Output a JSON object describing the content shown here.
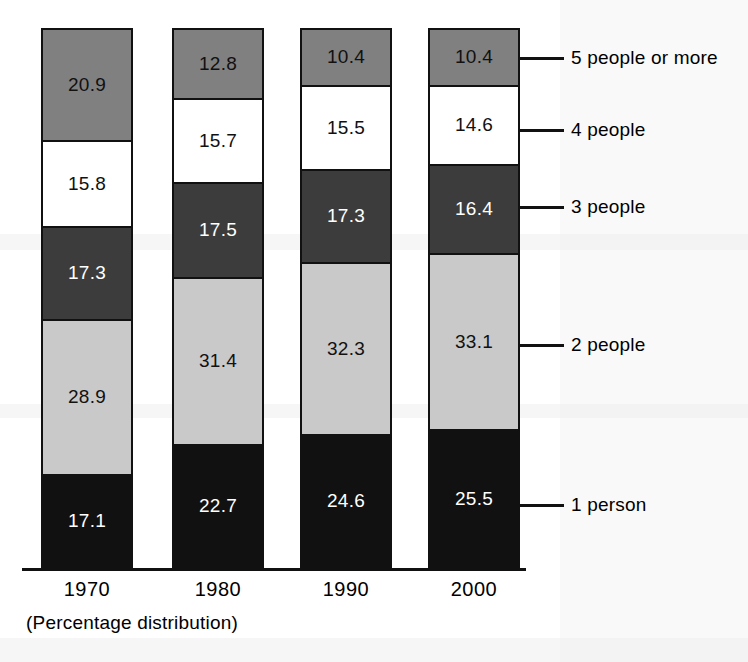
{
  "chart_data": {
    "type": "bar",
    "subtype": "stacked-bar-100-percent",
    "title": "",
    "caption": "(Percentage distribution)",
    "xlabel": "",
    "ylabel": "",
    "ylim": [
      0,
      100
    ],
    "grid": false,
    "legend_position": "right-of-bars-with-leader-lines",
    "categories": [
      "1970",
      "1980",
      "1990",
      "2000"
    ],
    "series": [
      {
        "name": "1 person",
        "values": [
          17.1,
          22.7,
          24.6,
          25.5
        ],
        "color": "#111111"
      },
      {
        "name": "2 people",
        "values": [
          28.9,
          31.4,
          32.3,
          33.1
        ],
        "color": "#c9c9c9"
      },
      {
        "name": "3 people",
        "values": [
          17.3,
          17.5,
          17.3,
          16.4
        ],
        "color": "#3c3c3c"
      },
      {
        "name": "4 people",
        "values": [
          15.8,
          15.7,
          15.5,
          14.6
        ],
        "color": "#ffffff"
      },
      {
        "name": "5 people or more",
        "values": [
          20.9,
          12.8,
          10.4,
          10.4
        ],
        "color": "#808080"
      }
    ]
  },
  "legend": {
    "entries": [
      {
        "label": "5 people or more"
      },
      {
        "label": "4 people"
      },
      {
        "label": "3 people"
      },
      {
        "label": "2 people"
      },
      {
        "label": "1 person"
      }
    ]
  },
  "axis": {
    "tick_labels": [
      "1970",
      "1980",
      "1990",
      "2000"
    ]
  },
  "caption": "(Percentage distribution)",
  "bars": [
    {
      "category": "1970",
      "segments": [
        {
          "key": "c5",
          "label": "20.9"
        },
        {
          "key": "c4",
          "label": "15.8"
        },
        {
          "key": "c3",
          "label": "17.3"
        },
        {
          "key": "c2",
          "label": "28.9"
        },
        {
          "key": "c1",
          "label": "17.1"
        }
      ]
    },
    {
      "category": "1980",
      "segments": [
        {
          "key": "c5",
          "label": "12.8"
        },
        {
          "key": "c4",
          "label": "15.7"
        },
        {
          "key": "c3",
          "label": "17.5"
        },
        {
          "key": "c2",
          "label": "31.4"
        },
        {
          "key": "c1",
          "label": "22.7"
        }
      ]
    },
    {
      "category": "1990",
      "segments": [
        {
          "key": "c5",
          "label": "10.4"
        },
        {
          "key": "c4",
          "label": "15.5"
        },
        {
          "key": "c3",
          "label": "17.3"
        },
        {
          "key": "c2",
          "label": "32.3"
        },
        {
          "key": "c1",
          "label": "24.6"
        }
      ]
    },
    {
      "category": "2000",
      "segments": [
        {
          "key": "c5",
          "label": "10.4"
        },
        {
          "key": "c4",
          "label": "14.6"
        },
        {
          "key": "c3",
          "label": "16.4"
        },
        {
          "key": "c2",
          "label": "33.1"
        },
        {
          "key": "c1",
          "label": "25.5"
        }
      ]
    }
  ],
  "colors": {
    "one_person": "#111111",
    "two_people": "#c9c9c9",
    "three_people": "#3c3c3c",
    "four_people": "#ffffff",
    "five_or_more": "#808080",
    "outline": "#111111",
    "background": "#ffffff"
  }
}
